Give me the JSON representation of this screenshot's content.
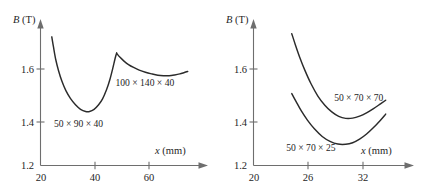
{
  "figure": {
    "background_color": "#ffffff",
    "curve_color": "#2b2b2b",
    "axis_color": "#6e6e6e",
    "panel_count": 2
  },
  "chart_data": [
    {
      "type": "line",
      "panel": "left",
      "title": "",
      "xlabel": "x (mm)",
      "ylabel": "B (T)",
      "xlabel_italic_part": "x",
      "xlabel_unit_part": " (mm)",
      "ylabel_italic_part": "B",
      "ylabel_unit_part": " (T)",
      "xlim": [
        20,
        73
      ],
      "ylim": [
        1.2,
        1.72
      ],
      "xticks": [
        20,
        40,
        60
      ],
      "xtick_labels": [
        "20",
        "40",
        "60"
      ],
      "yticks": [
        1.2,
        1.4,
        1.6
      ],
      "ytick_labels": [
        "1.2",
        "1.4",
        "1.6"
      ],
      "grid": false,
      "legend": "inline-annotations",
      "series": [
        {
          "name": "50 × 90 × 40",
          "label": "50 × 90 × 40",
          "label_x": 33.5,
          "label_y": 1.345,
          "x": [
            24.0,
            24.6,
            25.4,
            26.4,
            27.6,
            29.0,
            30.6,
            32.4,
            34.2,
            36.0,
            37.4,
            39.0,
            40.6,
            42.0,
            43.4,
            44.6,
            45.6,
            46.4,
            47.0
          ],
          "y": [
            1.683,
            1.645,
            1.598,
            1.556,
            1.516,
            1.481,
            1.452,
            1.428,
            1.411,
            1.403,
            1.403,
            1.411,
            1.428,
            1.45,
            1.484,
            1.523,
            1.564,
            1.6,
            1.623
          ]
        },
        {
          "name": "100 × 140 × 40",
          "label": "100 × 140 × 40",
          "label_x": 57.0,
          "label_y": 1.497,
          "x": [
            47.0,
            48.2,
            49.6,
            51.2,
            53.0,
            55.0,
            57.2,
            59.4,
            61.6,
            63.6,
            65.6,
            67.6,
            69.4,
            71.0,
            72.2
          ],
          "y": [
            1.621,
            1.606,
            1.592,
            1.579,
            1.568,
            1.558,
            1.55,
            1.544,
            1.539,
            1.537,
            1.537,
            1.54,
            1.544,
            1.549,
            1.553
          ]
        }
      ]
    },
    {
      "type": "line",
      "panel": "right",
      "title": "",
      "xlabel": "x (mm)",
      "ylabel": "B (T)",
      "xlabel_italic_part": "x",
      "xlabel_unit_part": " (mm)",
      "ylabel_italic_part": "B",
      "ylabel_unit_part": " (T)",
      "xlim": [
        20,
        36.5
      ],
      "ylim": [
        1.2,
        1.82
      ],
      "xticks": [
        20,
        26,
        32
      ],
      "xtick_labels": [
        "20",
        "26",
        "32"
      ],
      "yticks": [
        1.2,
        1.4,
        1.6
      ],
      "ytick_labels": [
        "1.2",
        "1.4",
        "1.6"
      ],
      "grid": false,
      "legend": "inline-annotations",
      "series": [
        {
          "name": "50 × 70 × 70",
          "label": "50 × 70 × 70",
          "label_x": 32.1,
          "label_y": 1.487,
          "x": [
            24.4,
            24.8,
            25.3,
            25.9,
            26.6,
            27.4,
            28.2,
            29.0,
            29.8,
            30.6,
            31.4,
            32.2,
            33.0,
            33.8,
            34.6,
            35.2
          ],
          "y": [
            1.79,
            1.742,
            1.686,
            1.627,
            1.567,
            1.511,
            1.47,
            1.44,
            1.42,
            1.411,
            1.412,
            1.421,
            1.436,
            1.455,
            1.476,
            1.492
          ]
        },
        {
          "name": "50 × 70 × 25",
          "label": "50 × 70 × 25",
          "label_x": 26.6,
          "label_y": 1.267,
          "x": [
            24.4,
            24.9,
            25.5,
            26.2,
            27.0,
            27.9,
            28.8,
            29.7,
            30.6,
            31.4,
            32.2,
            33.0,
            33.8,
            34.6,
            35.2
          ],
          "y": [
            1.522,
            1.486,
            1.444,
            1.403,
            1.364,
            1.33,
            1.308,
            1.296,
            1.295,
            1.302,
            1.318,
            1.341,
            1.37,
            1.403,
            1.43
          ]
        }
      ]
    }
  ]
}
